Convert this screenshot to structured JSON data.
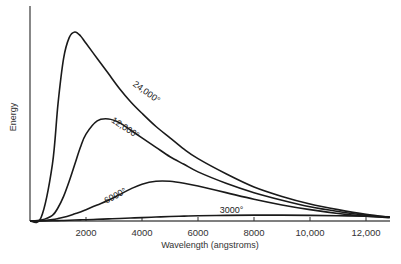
{
  "chart_data": {
    "type": "line",
    "title": "",
    "xlabel": "Wavelength (angstroms)",
    "ylabel": "Energy",
    "xlim": [
      0,
      12850
    ],
    "ylim": [
      0,
      100
    ],
    "x_ticks": [
      2000,
      4000,
      6000,
      8000,
      10000,
      12000
    ],
    "x_tick_labels": [
      "2000",
      "4000",
      "6000",
      "8000",
      "10,000",
      "12,000"
    ],
    "grid": false,
    "legend": "inline labels on curves",
    "x": [
      0,
      400,
      800,
      1000,
      1200,
      1400,
      1600,
      1800,
      2000,
      2400,
      2800,
      3200,
      3600,
      4000,
      4500,
      5000,
      5500,
      6000,
      7000,
      8000,
      9000,
      10000,
      11000,
      12000,
      12850
    ],
    "series": [
      {
        "name": "24,000°",
        "label": "24,000°",
        "values": [
          0,
          2,
          30,
          62,
          86,
          97,
          100,
          98,
          94,
          86,
          78,
          70,
          63,
          57,
          50,
          44,
          38,
          33,
          25,
          18,
          13,
          9,
          6,
          3.5,
          2
        ]
      },
      {
        "name": "12,000°",
        "label": "12,000°",
        "values": [
          0,
          0.5,
          3,
          7,
          13,
          21,
          30,
          39,
          46,
          53,
          54,
          52,
          48,
          44,
          39,
          34,
          30,
          26,
          20,
          15,
          11,
          7.5,
          5,
          3,
          2
        ]
      },
      {
        "name": "6000°",
        "label": "6000°",
        "values": [
          0,
          0.2,
          0.8,
          1.3,
          2,
          2.8,
          3.8,
          4.8,
          6,
          8.5,
          11,
          14,
          17,
          19.5,
          21,
          21,
          20,
          18.5,
          15,
          11.5,
          8.5,
          6,
          4,
          2.5,
          1.8
        ]
      },
      {
        "name": "3000°",
        "label": "3000°",
        "values": [
          0,
          0,
          0.1,
          0.2,
          0.3,
          0.4,
          0.5,
          0.6,
          0.7,
          0.9,
          1.1,
          1.3,
          1.6,
          1.8,
          2.1,
          2.4,
          2.6,
          2.8,
          3.0,
          3.1,
          3.1,
          3.0,
          2.8,
          2.5,
          2.2
        ]
      }
    ],
    "annotations": [
      {
        "text": "24,000°",
        "x": 4100,
        "y": 67,
        "rotate": 36
      },
      {
        "text": "12,000°",
        "x": 3350,
        "y": 48,
        "rotate": 33
      },
      {
        "text": "6000°",
        "x": 3100,
        "y": 12,
        "rotate": -28
      },
      {
        "text": "3000°",
        "x": 7200,
        "y": 4,
        "rotate": 0
      }
    ]
  }
}
